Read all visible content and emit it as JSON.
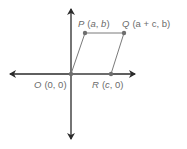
{
  "diagram": {
    "type": "coordinate-plane-parallelogram",
    "colors": {
      "axis": "#2a2a2a",
      "shape": "#7a7a7a",
      "point": "#6e6e6e",
      "label": "#6b6b6b"
    },
    "points": [
      {
        "id": "O",
        "name": "O",
        "coords": "(0, 0)",
        "x": 71,
        "y": 74
      },
      {
        "id": "P",
        "name": "P",
        "coords": "(a, b)",
        "x": 85,
        "y": 33
      },
      {
        "id": "Q",
        "name": "Q",
        "coords": "(a + c, b)",
        "x": 124,
        "y": 33
      },
      {
        "id": "R",
        "name": "R",
        "coords": "(c, 0)",
        "x": 111,
        "y": 74
      }
    ],
    "labels": {
      "O_name": "O",
      "O_coords": "(0, 0)",
      "P_name": "P",
      "P_coords_open": "(",
      "P_a": "a",
      "P_sep": ", ",
      "P_b": "b",
      "P_close": ")",
      "Q_name": "Q",
      "Q_coords": "(a + c, b)",
      "R_name": "R",
      "R_coords_open": "(",
      "R_c": "c",
      "R_rest": ", 0)"
    }
  }
}
